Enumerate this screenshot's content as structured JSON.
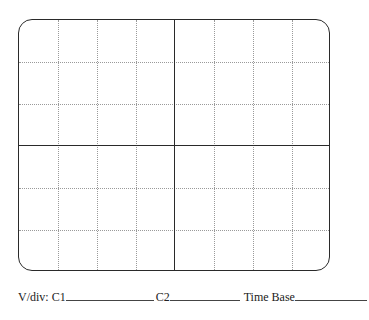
{
  "graticule": {
    "columns": 8,
    "rows": 6,
    "border_color": "#2a2a2a",
    "grid_color": "#9a9a9a"
  },
  "labels": {
    "vdiv": "V/div: C1",
    "c2": "C2",
    "time_base": "Time Base"
  }
}
